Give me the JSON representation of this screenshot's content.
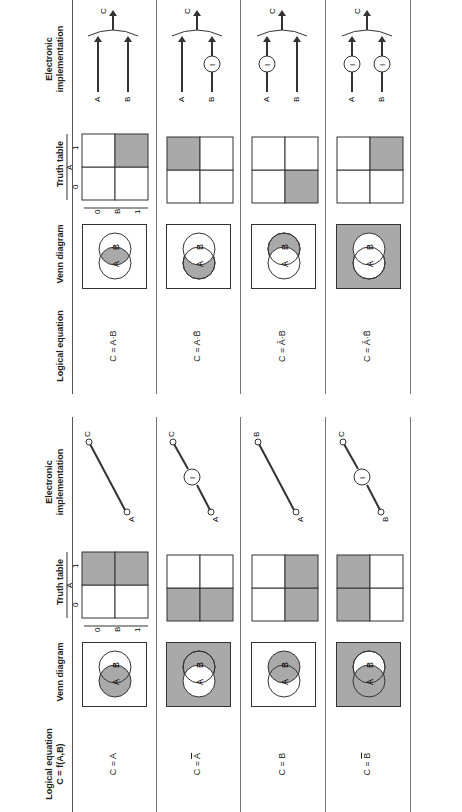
{
  "colors": {
    "shade": "#a9a9a9",
    "line": "#333333",
    "background": "#ffffff"
  },
  "left_table": {
    "headers": {
      "equation": [
        "Logical equation",
        "C = f(A,B)"
      ],
      "venn": "Venn diagram",
      "truth": "Truth table",
      "electronic": [
        "Electronic",
        "implementation"
      ]
    },
    "truth_axis": {
      "a_label": "A",
      "b_label": "B",
      "zero": "0",
      "one": "1"
    },
    "rows": [
      {
        "equation_prefix": "C = ",
        "equation_var": "A",
        "overbar": false,
        "venn_shade": "A",
        "truth_shaded": [
          "A1B0",
          "A1B1"
        ],
        "circuit": {
          "input": "A",
          "output": "C",
          "inverter": false,
          "inverter_label": "I"
        }
      },
      {
        "equation_prefix": "C = ",
        "equation_var": "A",
        "overbar": true,
        "venn_shade": "notA",
        "truth_shaded": [
          "A0B0",
          "A0B1"
        ],
        "circuit": {
          "input": "A",
          "output": "C",
          "inverter": true,
          "inverter_label": "I"
        }
      },
      {
        "equation_prefix": "C = ",
        "equation_var": "B",
        "overbar": false,
        "venn_shade": "B",
        "truth_shaded": [
          "A0B1",
          "A1B1"
        ],
        "circuit": {
          "input": "A",
          "output": "B",
          "inverter": false,
          "inverter_label": "I"
        }
      },
      {
        "equation_prefix": "C = ",
        "equation_var": "B",
        "overbar": true,
        "venn_shade": "notB",
        "truth_shaded": [
          "A0B0",
          "A1B0"
        ],
        "circuit": {
          "input": "B",
          "output": "C",
          "inverter": true,
          "inverter_label": "I"
        }
      }
    ]
  },
  "right_table": {
    "headers": {
      "equation": "Logical equation",
      "venn": "Venn diagram",
      "truth": "Truth table",
      "electronic": [
        "Electronic",
        "implementation"
      ]
    },
    "truth_axis": {
      "a_label": "A",
      "b_label": "B",
      "zero": "0",
      "one": "1"
    },
    "rows": [
      {
        "equation": "C = A·B",
        "a_bar": false,
        "b_bar": false,
        "venn_shade": "AandB",
        "truth_shaded": [
          "A1B1"
        ],
        "circuit": {
          "inputs": [
            "A",
            "B"
          ],
          "output": "C",
          "invert_a": false,
          "invert_b": false,
          "inverter_label": "I"
        }
      },
      {
        "equation": "C = A·B̄",
        "a_bar": false,
        "b_bar": true,
        "venn_shade": "AnotB",
        "truth_shaded": [
          "A0B0"
        ],
        "circuit": {
          "inputs": [
            "A",
            "B"
          ],
          "output": "C",
          "invert_a": false,
          "invert_b": true,
          "inverter_label": "I"
        }
      },
      {
        "equation": "C = Ā·B",
        "a_bar": true,
        "b_bar": false,
        "venn_shade": "BnotA",
        "truth_shaded": [
          "A1B1"
        ],
        "circuit": {
          "inputs": [
            "A",
            "B"
          ],
          "output": "C",
          "invert_a": true,
          "invert_b": false,
          "inverter_label": "I"
        }
      },
      {
        "equation": "C = Ā·B̄",
        "a_bar": true,
        "b_bar": true,
        "venn_shade": "neither",
        "truth_shaded": [
          "A0B1"
        ],
        "circuit": {
          "inputs": [
            "A",
            "B"
          ],
          "output": "C",
          "invert_a": true,
          "invert_b": true,
          "inverter_label": "I"
        }
      }
    ]
  }
}
